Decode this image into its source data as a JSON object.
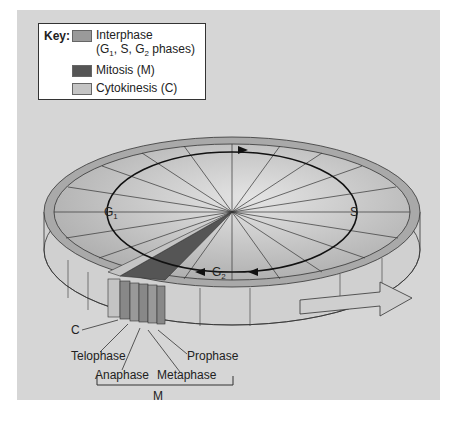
{
  "key": {
    "title": "Key:",
    "items": [
      {
        "label": "Interphase",
        "sublabel": "(G1, S, G2 phases)",
        "color": "#9a9a9a"
      },
      {
        "label": "Mitosis (M)",
        "color": "#555555"
      },
      {
        "label": "Cytokinesis (C)",
        "color": "#c4c4c4"
      }
    ]
  },
  "diagram": {
    "cycle_labels": {
      "g1": "G",
      "g1_sub": "1",
      "s": "S",
      "g2": "G",
      "g2_sub": "2"
    },
    "stage_labels": {
      "c": "C",
      "telophase": "Telophase",
      "anaphase": "Anaphase",
      "metaphase": "Metaphase",
      "prophase": "Prophase",
      "m": "M"
    }
  },
  "colors": {
    "background": "#d6d6d6",
    "disc_top": "#b8b8b8",
    "rim": "#a8a8a8",
    "mitosis": "#555555",
    "cytokinesis": "#c4c4c4"
  }
}
